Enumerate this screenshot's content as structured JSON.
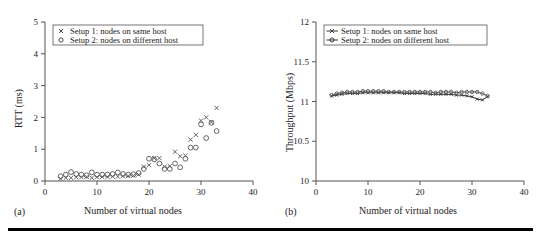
{
  "figure": {
    "bottom_rule_color": "#000000",
    "background": "#ffffff"
  },
  "panels": [
    {
      "caption": "(a)",
      "legend_items": [
        {
          "marker": "cross-marker",
          "label": "Setup 1: nodes on same host"
        },
        {
          "marker": "circle-marker",
          "label": "Setup 2: nodes on different host"
        }
      ]
    },
    {
      "caption": "(b)",
      "legend_items": [
        {
          "marker": "line-cross-marker",
          "label": "Setup 1: nodes on same host"
        },
        {
          "marker": "line-circle-marker",
          "label": "Setup 2: nodes on different host"
        }
      ]
    }
  ],
  "chart_data": [
    {
      "type": "scatter",
      "title": "",
      "xlabel": "Number of virtual nodes",
      "ylabel": "RTT (ms)",
      "xlim": [
        0,
        40
      ],
      "ylim": [
        0,
        5
      ],
      "xticks": [
        0,
        10,
        20,
        30,
        40
      ],
      "yticks": [
        0,
        1,
        2,
        3,
        4,
        5
      ],
      "grid": false,
      "legend_position": "top-left",
      "series": [
        {
          "name": "Setup 1: nodes on same host",
          "marker": "x",
          "color": "#555555",
          "x": [
            3,
            4,
            5,
            6,
            7,
            8,
            9,
            10,
            11,
            12,
            13,
            14,
            15,
            16,
            17,
            18,
            19,
            20,
            21,
            22,
            23,
            24,
            25,
            26,
            27,
            28,
            29,
            30,
            31,
            32,
            33
          ],
          "y": [
            0.07,
            0.1,
            0.1,
            0.12,
            0.12,
            0.13,
            0.1,
            0.12,
            0.13,
            0.13,
            0.14,
            0.14,
            0.15,
            0.16,
            0.17,
            0.2,
            0.45,
            0.5,
            0.72,
            0.72,
            0.45,
            0.47,
            0.92,
            0.78,
            0.8,
            1.3,
            1.45,
            1.9,
            2.0,
            1.85,
            2.3
          ]
        },
        {
          "name": "Setup 2: nodes on different host",
          "marker": "o",
          "color": "#555555",
          "x": [
            3,
            4,
            5,
            6,
            7,
            8,
            9,
            10,
            11,
            12,
            13,
            14,
            15,
            16,
            17,
            18,
            19,
            20,
            21,
            22,
            23,
            24,
            25,
            26,
            27,
            28,
            29,
            30,
            31,
            32,
            33
          ],
          "y": [
            0.15,
            0.2,
            0.28,
            0.22,
            0.2,
            0.18,
            0.27,
            0.2,
            0.2,
            0.2,
            0.22,
            0.27,
            0.22,
            0.2,
            0.21,
            0.25,
            0.38,
            0.7,
            0.68,
            0.55,
            0.38,
            0.38,
            0.55,
            0.43,
            0.7,
            1.05,
            1.05,
            1.78,
            1.35,
            1.83,
            1.57
          ]
        }
      ]
    },
    {
      "type": "line",
      "title": "",
      "xlabel": "Number of virtual nodes",
      "ylabel": "Throughput (Mbps)",
      "xlim": [
        0,
        40
      ],
      "ylim": [
        10,
        12
      ],
      "xticks": [
        0,
        10,
        20,
        30,
        40
      ],
      "yticks": [
        10,
        10.5,
        11,
        11.5,
        12
      ],
      "grid": false,
      "legend_position": "top-left",
      "series": [
        {
          "name": "Setup 1: nodes on same host",
          "marker": "x",
          "color": "#333333",
          "x": [
            3,
            4,
            5,
            6,
            7,
            8,
            9,
            10,
            11,
            12,
            13,
            14,
            15,
            16,
            17,
            18,
            19,
            20,
            21,
            22,
            23,
            24,
            25,
            26,
            27,
            28,
            29,
            30,
            31,
            32,
            33
          ],
          "y": [
            11.07,
            11.08,
            11.09,
            11.1,
            11.1,
            11.1,
            11.11,
            11.11,
            11.11,
            11.11,
            11.11,
            11.11,
            11.11,
            11.11,
            11.1,
            11.1,
            11.1,
            11.1,
            11.1,
            11.09,
            11.09,
            11.09,
            11.09,
            11.09,
            11.08,
            11.08,
            11.07,
            11.06,
            11.03,
            11.02,
            11.06
          ]
        },
        {
          "name": "Setup 2: nodes on different host",
          "marker": "o",
          "color": "#555555",
          "x": [
            3,
            4,
            5,
            6,
            7,
            8,
            9,
            10,
            11,
            12,
            13,
            14,
            15,
            16,
            17,
            18,
            19,
            20,
            21,
            22,
            23,
            24,
            25,
            26,
            27,
            28,
            29,
            30,
            31,
            32,
            33
          ],
          "y": [
            11.08,
            11.1,
            11.11,
            11.12,
            11.12,
            11.12,
            11.13,
            11.13,
            11.13,
            11.13,
            11.13,
            11.12,
            11.12,
            11.12,
            11.12,
            11.12,
            11.12,
            11.12,
            11.12,
            11.12,
            11.11,
            11.12,
            11.12,
            11.12,
            11.11,
            11.12,
            11.12,
            11.12,
            11.12,
            11.1,
            11.07
          ]
        }
      ]
    }
  ]
}
